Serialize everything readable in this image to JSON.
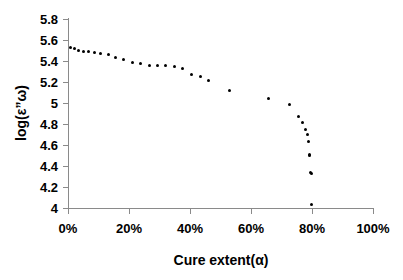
{
  "chart_data": {
    "type": "scatter",
    "title": "",
    "xlabel": "Cure extent(α)",
    "ylabel": "log(ε”ω)",
    "xlim": [
      0,
      100
    ],
    "ylim": [
      4,
      5.8
    ],
    "grid": false,
    "legend": null,
    "marker": {
      "shape": "circle",
      "color": "#000000",
      "size_px": 3
    },
    "x_tick_labels": [
      "0%",
      "20%",
      "40%",
      "60%",
      "80%",
      "100%"
    ],
    "x_tick_values": [
      0,
      20,
      40,
      60,
      80,
      100
    ],
    "y_tick_labels": [
      "4",
      "4.2",
      "4.4",
      "4.6",
      "4.8",
      "5",
      "5.2",
      "5.4",
      "5.6",
      "5.8"
    ],
    "y_tick_values": [
      4,
      4.2,
      4.4,
      4.6,
      4.8,
      5,
      5.2,
      5.4,
      5.6,
      5.8
    ],
    "series": [
      {
        "name": "log(ε”ω) vs cure extent",
        "points": [
          [
            0.8,
            5.53
          ],
          [
            2.0,
            5.52
          ],
          [
            3.4,
            5.5
          ],
          [
            5.0,
            5.49
          ],
          [
            6.8,
            5.49
          ],
          [
            8.8,
            5.48
          ],
          [
            10.8,
            5.47
          ],
          [
            13.2,
            5.46
          ],
          [
            15.6,
            5.43
          ],
          [
            18.2,
            5.41
          ],
          [
            21.0,
            5.39
          ],
          [
            23.8,
            5.38
          ],
          [
            26.6,
            5.36
          ],
          [
            29.4,
            5.355
          ],
          [
            32.0,
            5.36
          ],
          [
            34.8,
            5.35
          ],
          [
            37.6,
            5.33
          ],
          [
            40.6,
            5.27
          ],
          [
            43.6,
            5.25
          ],
          [
            46.2,
            5.21
          ],
          [
            53.0,
            5.12
          ],
          [
            65.8,
            5.04
          ],
          [
            72.6,
            4.99
          ],
          [
            75.6,
            4.87
          ],
          [
            77.0,
            4.81
          ],
          [
            77.8,
            4.75
          ],
          [
            78.4,
            4.7
          ],
          [
            78.8,
            4.63
          ],
          [
            79.2,
            4.51
          ],
          [
            79.3,
            4.5
          ],
          [
            79.6,
            4.34
          ],
          [
            79.7,
            4.33
          ],
          [
            79.9,
            4.03
          ]
        ]
      }
    ]
  }
}
